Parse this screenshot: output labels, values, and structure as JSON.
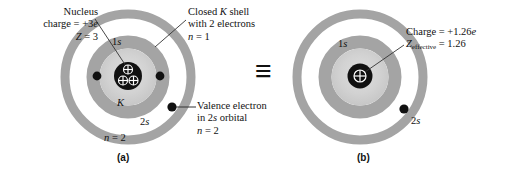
{
  "figure": {
    "equivalence_symbol": "≡",
    "colors": {
      "outer_ring": "#a6a6a6",
      "inner_ring": "#a6a6a6",
      "core_disc": "#c9c9c9",
      "core_disc_inner": "#d8d8d8",
      "nucleus": "#111111",
      "electron": "#111111",
      "background": "#ffffff",
      "text": "#111111",
      "leader_line": "#333333"
    }
  },
  "panel_a": {
    "caption": "(a)",
    "labels": {
      "nucleus_line1": "Nucleus",
      "nucleus_line2_pre": "charge = +3",
      "nucleus_line2_italic": "e",
      "nucleus_line3_italic": "Z",
      "nucleus_line3_post": " = 3",
      "kshell_line1_pre": "Closed ",
      "kshell_line1_italic": "K",
      "kshell_line1_post": " shell",
      "kshell_line2": "with 2 electrons",
      "kshell_line3_italic": "n",
      "kshell_line3_post": " = 1",
      "valence_line1": "Valence electron",
      "valence_line2_pre": "in 2",
      "valence_line2_italic": "s",
      "valence_line2_post": " orbital",
      "valence_line3_italic": "n",
      "valence_line3_post": " = 2"
    },
    "inner_labels": {
      "orbital_1s_num": "1",
      "orbital_1s_letter": "s",
      "shell_K": "K",
      "orbital_2s_num": "2",
      "orbital_2s_letter": "s",
      "n_equals_italic": "n",
      "n_equals_post": " = 2"
    },
    "nucleus": {
      "proton_symbol": "⊕",
      "proton_count": 3,
      "charge": "+3e",
      "atomic_number": 3
    },
    "electrons": {
      "k_shell_count": 2,
      "valence_count": 1
    }
  },
  "panel_b": {
    "caption": "(b)",
    "labels": {
      "charge_line1_pre": "Charge = +1.26",
      "charge_line1_italic": "e",
      "charge_line2_italic": "Z",
      "charge_line2_sub": "effective",
      "charge_line2_post": " = 1.26"
    },
    "inner_labels": {
      "orbital_1s_num": "1",
      "orbital_1s_letter": "s",
      "orbital_2s_num": "2",
      "orbital_2s_letter": "s"
    },
    "nucleus": {
      "proton_symbol": "⊕",
      "proton_count": 1,
      "charge": "+1.26e",
      "z_effective": "1.26"
    },
    "electrons": {
      "valence_count": 1
    }
  }
}
